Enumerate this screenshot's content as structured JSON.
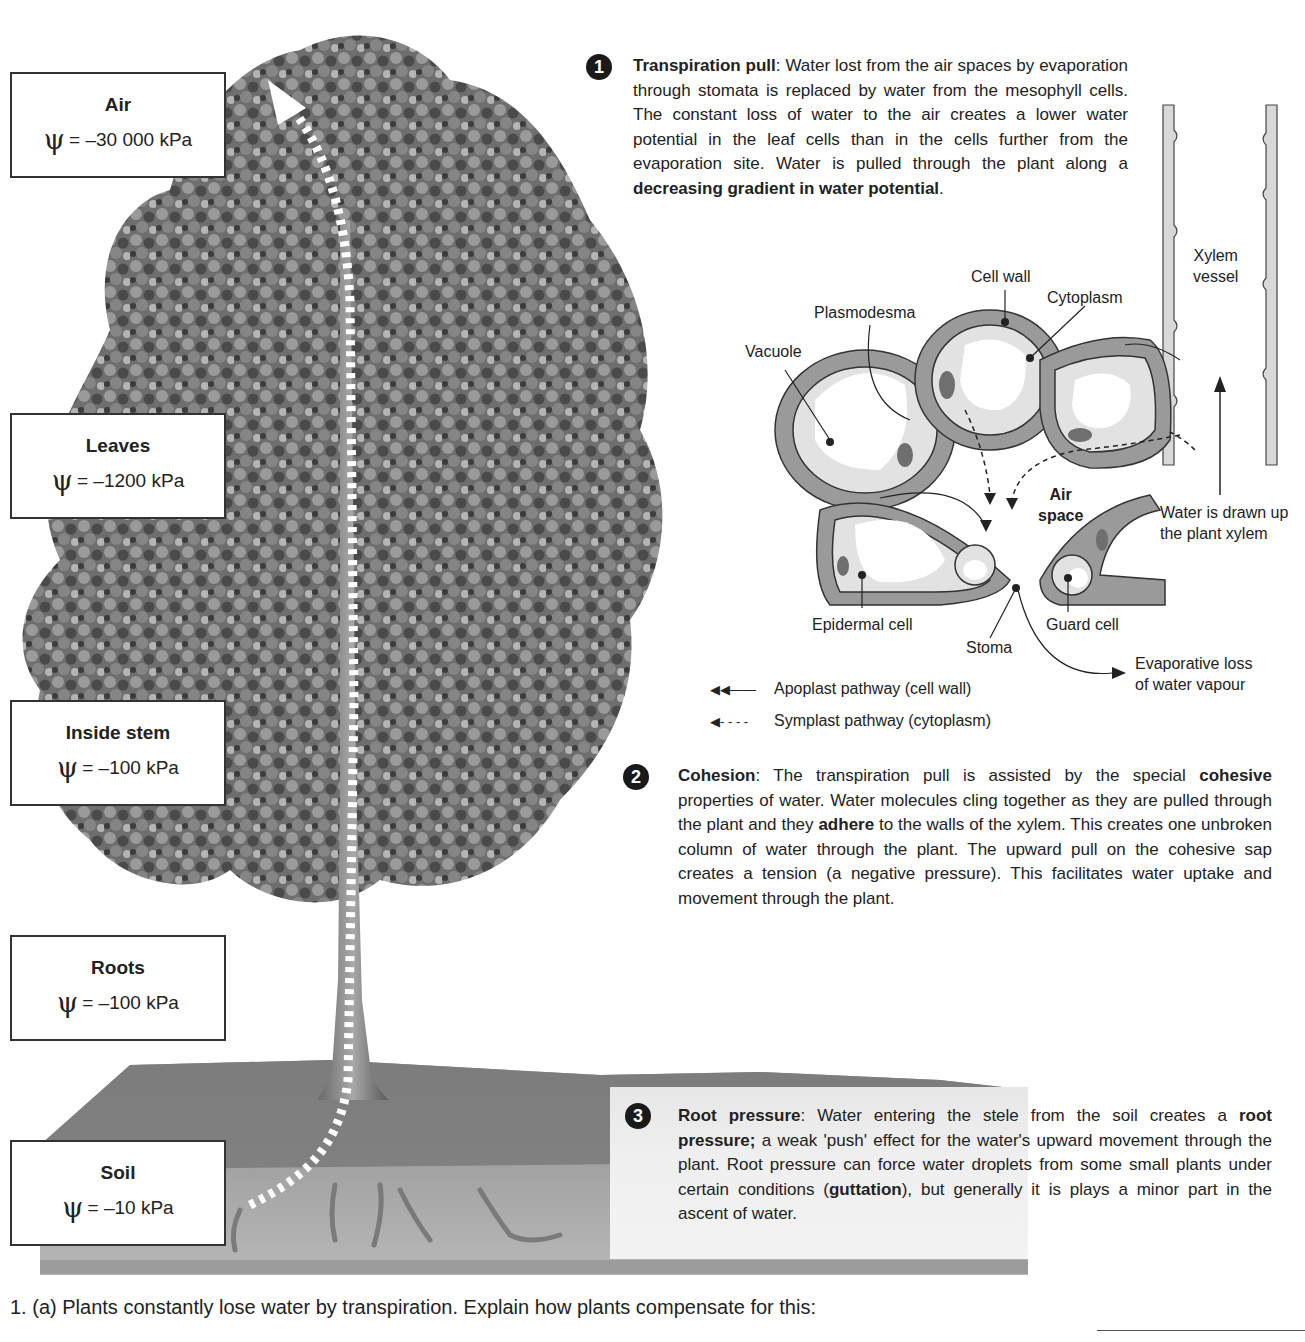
{
  "psi_symbol": "ψ",
  "potentials": [
    {
      "location": "Air",
      "value": "= –30 000 kPa"
    },
    {
      "location": "Leaves",
      "value": "= –1200 kPa"
    },
    {
      "location": "Inside stem",
      "value": "= –100 kPa"
    },
    {
      "location": "Roots",
      "value": "= –100 kPa"
    },
    {
      "location": "Soil",
      "value": "= –10 kPa"
    }
  ],
  "sections": [
    {
      "number": "1",
      "title": "Transpiration pull",
      "text_a": ":  Water lost from the air spaces by evaporation through stomata is replaced by water from the mesophyll cells. The constant loss of water to the air creates a lower water potential in the leaf cells than in the cells further from the evaporation site. Water is pulled through the plant along a ",
      "bold_a": "decreasing gradient in water potential",
      "text_b": "."
    },
    {
      "number": "2",
      "title": "Cohesion",
      "text_a": ":  The transpiration pull is assisted by the special ",
      "bold_a": "cohesive",
      "text_b": " properties of water. Water molecules cling together as they are pulled through the plant and they ",
      "bold_b": "adhere",
      "text_c": " to the walls of the xylem. This creates one unbroken column of water through the plant. The upward pull on the cohesive sap creates a tension (a negative pressure). This facilitates water uptake and movement through the plant."
    },
    {
      "number": "3",
      "title": "Root pressure",
      "text_a": ":  Water entering the stele from the soil creates a ",
      "bold_a": "root pressure;",
      "text_b": " a weak 'push' effect for the water's upward movement through the plant. Root pressure can force water droplets from some small plants under certain conditions (",
      "bold_b": "guttation",
      "text_c": "), but generally it is plays a minor part in the ascent of water."
    }
  ],
  "diagram": {
    "labels": {
      "cell_wall": "Cell wall",
      "cytoplasm": "Cytoplasm",
      "plasmodesma": "Plasmodesma",
      "vacuole": "Vacuole",
      "xylem_vessel_1": "Xylem",
      "xylem_vessel_2": "vessel",
      "air_space_1": "Air",
      "air_space_2": "space",
      "water_drawn_1": "Water is drawn up",
      "water_drawn_2": "the plant xylem",
      "epidermal_cell": "Epidermal cell",
      "guard_cell": "Guard cell",
      "stoma": "Stoma",
      "evap_1": "Evaporative loss",
      "evap_2": "of water vapour"
    },
    "legend": [
      {
        "symbol": "◀◀——",
        "label": "Apoplast pathway (cell wall)"
      },
      {
        "symbol": "◀- - - -",
        "label": "Symplast pathway (cytoplasm)"
      }
    ]
  },
  "question": {
    "text": "1.  (a) Plants constantly lose water by transpiration. Explain how plants compensate for this:"
  }
}
